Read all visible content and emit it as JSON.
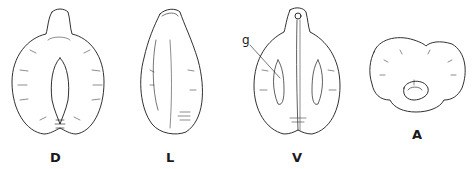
{
  "figure": {
    "views": [
      {
        "id": "dorsal",
        "label": "D"
      },
      {
        "id": "lateral",
        "label": "L"
      },
      {
        "id": "ventral",
        "label": "V"
      },
      {
        "id": "apical",
        "label": "A"
      }
    ],
    "annotations": [
      {
        "label": "g",
        "target": "ventral"
      }
    ],
    "colors": {
      "ink": "#1a1a1a",
      "background": "#ffffff"
    }
  }
}
